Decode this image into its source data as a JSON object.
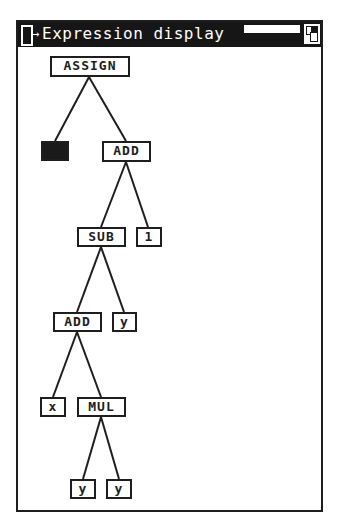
{
  "window": {
    "title": "Expression display",
    "close_icon": "close-box-icon",
    "zoom_icon": "zoom-box-icon"
  },
  "tree": {
    "nodes": [
      {
        "id": "n0",
        "label": "ASSIGN",
        "x": 50,
        "y": 56,
        "w": 80,
        "h": 21,
        "filled": false
      },
      {
        "id": "n1",
        "label": "",
        "x": 41,
        "y": 141,
        "w": 28,
        "h": 20,
        "filled": true
      },
      {
        "id": "n2",
        "label": "ADD",
        "x": 102,
        "y": 141,
        "w": 49,
        "h": 21,
        "filled": false
      },
      {
        "id": "n3",
        "label": "SUB",
        "x": 77,
        "y": 227,
        "w": 49,
        "h": 20,
        "filled": false
      },
      {
        "id": "n4",
        "label": "1",
        "x": 136,
        "y": 227,
        "w": 26,
        "h": 20,
        "filled": false
      },
      {
        "id": "n5",
        "label": "ADD",
        "x": 53,
        "y": 312,
        "w": 49,
        "h": 20,
        "filled": false
      },
      {
        "id": "n6",
        "label": "y",
        "x": 112,
        "y": 312,
        "w": 25,
        "h": 20,
        "filled": false
      },
      {
        "id": "n7",
        "label": "x",
        "x": 40,
        "y": 397,
        "w": 26,
        "h": 20,
        "filled": false
      },
      {
        "id": "n8",
        "label": "MUL",
        "x": 77,
        "y": 397,
        "w": 49,
        "h": 20,
        "filled": false
      },
      {
        "id": "n9",
        "label": "y",
        "x": 70,
        "y": 479,
        "w": 26,
        "h": 20,
        "filled": false
      },
      {
        "id": "n10",
        "label": "y",
        "x": 106,
        "y": 479,
        "w": 26,
        "h": 20,
        "filled": false
      }
    ],
    "edges": [
      {
        "from": [
          89,
          77
        ],
        "to": [
          55,
          141
        ]
      },
      {
        "from": [
          89,
          77
        ],
        "to": [
          126,
          141
        ]
      },
      {
        "from": [
          126,
          162
        ],
        "to": [
          101,
          227
        ]
      },
      {
        "from": [
          126,
          162
        ],
        "to": [
          148,
          227
        ]
      },
      {
        "from": [
          101,
          247
        ],
        "to": [
          77,
          312
        ]
      },
      {
        "from": [
          101,
          247
        ],
        "to": [
          124,
          312
        ]
      },
      {
        "from": [
          77,
          332
        ],
        "to": [
          53,
          397
        ]
      },
      {
        "from": [
          77,
          332
        ],
        "to": [
          101,
          397
        ]
      },
      {
        "from": [
          101,
          417
        ],
        "to": [
          83,
          479
        ]
      },
      {
        "from": [
          101,
          417
        ],
        "to": [
          119,
          479
        ]
      }
    ]
  }
}
